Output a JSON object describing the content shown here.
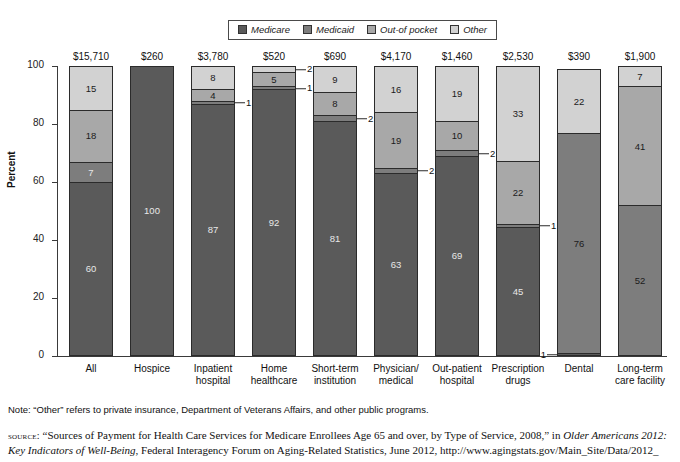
{
  "legend": {
    "items": [
      {
        "label": "Medicare",
        "color": "#5a5a5a"
      },
      {
        "label": "Medicaid",
        "color": "#7d7d7d"
      },
      {
        "label": "Out-of pocket",
        "color": "#a8a8a8"
      },
      {
        "label": "Other",
        "color": "#d2d2d2"
      }
    ]
  },
  "chart_data": {
    "type": "bar",
    "subtype": "stacked-100-percent",
    "title": "",
    "xlabel": "",
    "ylabel": "Percent",
    "ylim": [
      0,
      100
    ],
    "yticks": [
      0,
      20,
      40,
      60,
      80,
      100
    ],
    "grid": false,
    "legend_position": "top-center",
    "series_order": [
      "Medicare",
      "Medicaid",
      "Out-of pocket",
      "Other"
    ],
    "categories": [
      "All",
      "Hospice",
      "Inpatient hospital",
      "Home healthcare",
      "Short-term institution",
      "Physician/ medical",
      "Out-patient hospital",
      "Prescription drugs",
      "Dental",
      "Long-term care facility"
    ],
    "bar_totals": [
      "$15,710",
      "$260",
      "$3,780",
      "$520",
      "$690",
      "$4,170",
      "$1,460",
      "$2,530",
      "$390",
      "$1,900"
    ],
    "series": [
      {
        "name": "Medicare",
        "values": [
          60,
          100,
          87,
          92,
          81,
          63,
          69,
          45,
          1,
          0
        ]
      },
      {
        "name": "Medicaid",
        "values": [
          7,
          0,
          1,
          1,
          2,
          2,
          2,
          1,
          76,
          52
        ]
      },
      {
        "name": "Out-of pocket",
        "values": [
          18,
          0,
          4,
          5,
          8,
          19,
          10,
          22,
          0,
          41
        ]
      },
      {
        "name": "Other",
        "values": [
          15,
          0,
          8,
          2,
          9,
          16,
          19,
          33,
          22,
          7
        ]
      }
    ]
  },
  "bars": [
    {
      "category_line1": "All",
      "category_line2": "",
      "total": "$15,710",
      "segments": [
        {
          "label": "60",
          "value": 60,
          "series": "Medicare",
          "tone": "dark",
          "callout": false,
          "callout_side": "right"
        },
        {
          "label": "7",
          "value": 7,
          "series": "Medicaid",
          "tone": "dark",
          "callout": false,
          "callout_side": "right"
        },
        {
          "label": "18",
          "value": 18,
          "series": "Out-of pocket",
          "tone": "light",
          "callout": false,
          "callout_side": "right"
        },
        {
          "label": "15",
          "value": 15,
          "series": "Other",
          "tone": "light",
          "callout": false,
          "callout_side": "right"
        }
      ]
    },
    {
      "category_line1": "Hospice",
      "category_line2": "",
      "total": "$260",
      "segments": [
        {
          "label": "100",
          "value": 100,
          "series": "Medicare",
          "tone": "dark",
          "callout": false,
          "callout_side": "right"
        }
      ]
    },
    {
      "category_line1": "Inpatient",
      "category_line2": "hospital",
      "total": "$3,780",
      "segments": [
        {
          "label": "87",
          "value": 87,
          "series": "Medicare",
          "tone": "dark",
          "callout": false,
          "callout_side": "right"
        },
        {
          "label": "1",
          "value": 1,
          "series": "Medicaid",
          "tone": "light",
          "callout": true,
          "callout_side": "right"
        },
        {
          "label": "4",
          "value": 4,
          "series": "Out-of pocket",
          "tone": "light",
          "callout": false,
          "callout_side": "right"
        },
        {
          "label": "8",
          "value": 8,
          "series": "Other",
          "tone": "light",
          "callout": false,
          "callout_side": "right"
        }
      ]
    },
    {
      "category_line1": "Home",
      "category_line2": "healthcare",
      "total": "$520",
      "segments": [
        {
          "label": "92",
          "value": 92,
          "series": "Medicare",
          "tone": "dark",
          "callout": false,
          "callout_side": "right"
        },
        {
          "label": "1",
          "value": 1,
          "series": "Medicaid",
          "tone": "light",
          "callout": true,
          "callout_side": "right"
        },
        {
          "label": "5",
          "value": 5,
          "series": "Out-of pocket",
          "tone": "light",
          "callout": false,
          "callout_side": "right"
        },
        {
          "label": "2",
          "value": 2,
          "series": "Other",
          "tone": "light",
          "callout": true,
          "callout_side": "right"
        }
      ]
    },
    {
      "category_line1": "Short-term",
      "category_line2": "institution",
      "total": "$690",
      "segments": [
        {
          "label": "81",
          "value": 81,
          "series": "Medicare",
          "tone": "dark",
          "callout": false,
          "callout_side": "right"
        },
        {
          "label": "2",
          "value": 2,
          "series": "Medicaid",
          "tone": "light",
          "callout": true,
          "callout_side": "right"
        },
        {
          "label": "8",
          "value": 8,
          "series": "Out-of pocket",
          "tone": "light",
          "callout": false,
          "callout_side": "right"
        },
        {
          "label": "9",
          "value": 9,
          "series": "Other",
          "tone": "light",
          "callout": false,
          "callout_side": "right"
        }
      ]
    },
    {
      "category_line1": "Physician/",
      "category_line2": "medical",
      "total": "$4,170",
      "segments": [
        {
          "label": "63",
          "value": 63,
          "series": "Medicare",
          "tone": "dark",
          "callout": false,
          "callout_side": "right"
        },
        {
          "label": "2",
          "value": 2,
          "series": "Medicaid",
          "tone": "light",
          "callout": true,
          "callout_side": "right"
        },
        {
          "label": "19",
          "value": 19,
          "series": "Out-of pocket",
          "tone": "light",
          "callout": false,
          "callout_side": "right"
        },
        {
          "label": "16",
          "value": 16,
          "series": "Other",
          "tone": "light",
          "callout": false,
          "callout_side": "right"
        }
      ]
    },
    {
      "category_line1": "Out-patient",
      "category_line2": "hospital",
      "total": "$1,460",
      "segments": [
        {
          "label": "69",
          "value": 69,
          "series": "Medicare",
          "tone": "dark",
          "callout": false,
          "callout_side": "right"
        },
        {
          "label": "2",
          "value": 2,
          "series": "Medicaid",
          "tone": "light",
          "callout": true,
          "callout_side": "right"
        },
        {
          "label": "10",
          "value": 10,
          "series": "Out-of pocket",
          "tone": "light",
          "callout": false,
          "callout_side": "right"
        },
        {
          "label": "19",
          "value": 19,
          "series": "Other",
          "tone": "light",
          "callout": false,
          "callout_side": "right"
        }
      ]
    },
    {
      "category_line1": "Prescription",
      "category_line2": "drugs",
      "total": "$2,530",
      "segments": [
        {
          "label": "45",
          "value": 45,
          "series": "Medicare",
          "tone": "dark",
          "callout": false,
          "callout_side": "right"
        },
        {
          "label": "1",
          "value": 1,
          "series": "Medicaid",
          "tone": "light",
          "callout": true,
          "callout_side": "right"
        },
        {
          "label": "22",
          "value": 22,
          "series": "Out-of pocket",
          "tone": "light",
          "callout": false,
          "callout_side": "right"
        },
        {
          "label": "33",
          "value": 33,
          "series": "Other",
          "tone": "light",
          "callout": false,
          "callout_side": "right"
        }
      ]
    },
    {
      "category_line1": "Dental",
      "category_line2": "",
      "total": "$390",
      "segments": [
        {
          "label": "1",
          "value": 1,
          "series": "Medicare",
          "tone": "dark",
          "callout": true,
          "callout_side": "left"
        },
        {
          "label": "76",
          "value": 76,
          "series": "Medicaid",
          "tone": "light",
          "callout": false,
          "callout_side": "right"
        },
        {
          "label": "22",
          "value": 22,
          "series": "Other",
          "tone": "light",
          "callout": false,
          "callout_side": "right"
        }
      ]
    },
    {
      "category_line1": "Long-term",
      "category_line2": "care facility",
      "total": "$1,900",
      "segments": [
        {
          "label": "52",
          "value": 52,
          "series": "Medicaid",
          "tone": "light",
          "callout": false,
          "callout_side": "right"
        },
        {
          "label": "41",
          "value": 41,
          "series": "Out-of pocket",
          "tone": "light",
          "callout": false,
          "callout_side": "right"
        },
        {
          "label": "7",
          "value": 7,
          "series": "Other",
          "tone": "light",
          "callout": false,
          "callout_side": "right"
        }
      ]
    }
  ],
  "footnotes": {
    "note": "Note: “Other” refers to private insurance, Department of Veterans Affairs, and other public programs.",
    "source_kicker": "source:",
    "source_part1": " “Sources of Payment for Health Care Services for Medicare Enrollees Age 65 and over, by Type of Service, 2008,” in ",
    "source_italic1": "Older Americans 2012: Key Indicators of Well-Being",
    "source_part2": ", Federal Interagency Forum on Aging-Related Statistics, June 2012, http://www.agingstats.gov/Main_Site/Data/2012_"
  }
}
